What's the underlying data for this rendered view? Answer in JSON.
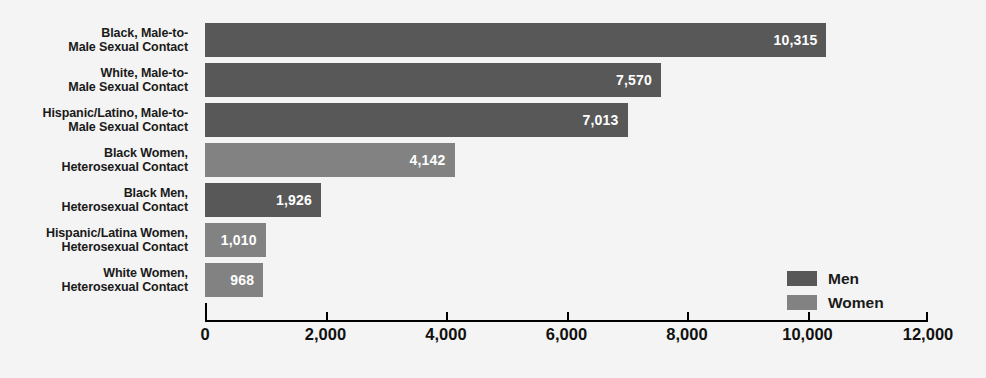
{
  "chart_data": {
    "type": "bar",
    "orientation": "horizontal",
    "title": "",
    "subtitle": "",
    "xlabel": "",
    "ylabel": "",
    "xlim": [
      0,
      12000
    ],
    "grid": false,
    "legend_position": "bottom-right",
    "xticks": [
      "0",
      "2,000",
      "4,000",
      "6,000",
      "8,000",
      "10,000",
      "12,000"
    ],
    "xtick_values": [
      0,
      2000,
      4000,
      6000,
      8000,
      10000,
      12000
    ],
    "categories": [
      "Black, Male-to-Male Sexual Contact",
      "White, Male-to-Male Sexual Contact",
      "Hispanic/Latino, Male-to-Male Sexual Contact",
      "Black Women, Heterosexual Contact",
      "Black Men, Heterosexual Contact",
      "Hispanic/Latina Women, Heterosexual Contact",
      "White Women, Heterosexual Contact"
    ],
    "values": [
      10315,
      7570,
      7013,
      4142,
      1926,
      1010,
      968
    ],
    "value_labels": [
      "10,315",
      "7,570",
      "7,013",
      "4,142",
      "1,926",
      "1,010",
      "968"
    ],
    "series_of_bar": [
      "Men",
      "Men",
      "Men",
      "Women",
      "Men",
      "Women",
      "Women"
    ],
    "series": [
      {
        "name": "Men",
        "color": "#585858"
      },
      {
        "name": "Women",
        "color": "#828282"
      }
    ]
  },
  "rows": [
    {
      "label_line1": "Black, Male-to-",
      "label_line2": "Male Sexual Contact",
      "value_label": "10,315",
      "series": "men"
    },
    {
      "label_line1": "White, Male-to-",
      "label_line2": "Male Sexual Contact",
      "value_label": "7,570",
      "series": "men"
    },
    {
      "label_line1": "Hispanic/Latino, Male-to-",
      "label_line2": "Male Sexual Contact",
      "value_label": "7,013",
      "series": "men"
    },
    {
      "label_line1": "Black Women,",
      "label_line2": "Heterosexual Contact",
      "value_label": "4,142",
      "series": "women"
    },
    {
      "label_line1": "Black Men,",
      "label_line2": "Heterosexual Contact",
      "value_label": "1,926",
      "series": "men"
    },
    {
      "label_line1": "Hispanic/Latina Women,",
      "label_line2": "Heterosexual Contact",
      "value_label": "1,010",
      "series": "women"
    },
    {
      "label_line1": "White Women,",
      "label_line2": "Heterosexual Contact",
      "value_label": "968",
      "series": "women"
    }
  ],
  "axis": {
    "ticks": [
      {
        "label": "0",
        "value": 0
      },
      {
        "label": "2,000",
        "value": 2000
      },
      {
        "label": "4,000",
        "value": 4000
      },
      {
        "label": "6,000",
        "value": 6000
      },
      {
        "label": "8,000",
        "value": 8000
      },
      {
        "label": "10,000",
        "value": 10000
      },
      {
        "label": "12,000",
        "value": 12000
      }
    ]
  },
  "legend": {
    "items": [
      {
        "label": "Men",
        "color": "#585858"
      },
      {
        "label": "Women",
        "color": "#828282"
      }
    ]
  },
  "colors": {
    "men": "#585858",
    "women": "#828282",
    "background": "#f4f4f4",
    "axis": "#000000",
    "value_text": "#ffffff"
  }
}
